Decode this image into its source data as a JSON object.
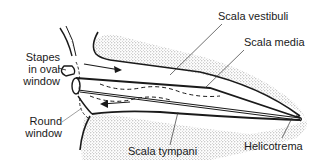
{
  "diagram": {
    "labels": {
      "stapes_line1": "Stapes",
      "stapes_line2": "in oval",
      "stapes_line3": "window",
      "round_line1": "Round",
      "round_line2": "window",
      "scala_vestibuli": "Scala vestibuli",
      "scala_media": "Scala media",
      "helicotrema": "Helicotrema",
      "scala_tympani": "Scala tympani"
    },
    "colors": {
      "ink": "#1a1a1a",
      "stipple": "#8a8a8a",
      "background": "#ffffff"
    }
  }
}
